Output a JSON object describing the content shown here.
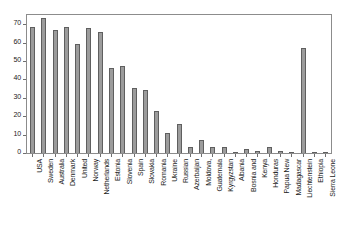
{
  "chart_data": {
    "type": "bar",
    "title": "",
    "subtitle": "",
    "xlabel": "",
    "ylabel": "",
    "grid": false,
    "legend": "none",
    "orientation": "vertical",
    "bar_color": "#9c9c9c",
    "bar_edge_color": "#5f5f5f",
    "axis_color": "#8c8c8c",
    "background": "#ffffff",
    "ylim": [
      0,
      75
    ],
    "yticks": [
      0,
      10,
      20,
      30,
      40,
      50,
      60,
      70
    ],
    "ytick_labels": [
      "0",
      "10",
      "20",
      "30",
      "40",
      "50",
      "60",
      "70"
    ],
    "categories": [
      "USA",
      "Sweden",
      "Australia",
      "Denmark",
      "United",
      "Norway",
      "Netherlands",
      "Estonia",
      "Slovenia",
      "Spain",
      "Slovakia",
      "Romania",
      "Ukraine",
      "Russian",
      "Azerbaijan",
      "Moldova,",
      "Guatemala",
      "Kyrgyzstan",
      "Albania",
      "Bosnia and",
      "Kenya",
      "Honduras",
      "Papua New",
      "Madagascar",
      "Liechtenstein",
      "Ethiopia",
      "Sierra Leone"
    ],
    "values": [
      68.5,
      73.5,
      67,
      68.5,
      59.5,
      68,
      66,
      46,
      47.5,
      35.5,
      34,
      23,
      11,
      15.5,
      3.5,
      7,
      3,
      3.5,
      0.7,
      2,
      1.2,
      3.5,
      1,
      0.4,
      57,
      0.15,
      0.5
    ]
  }
}
